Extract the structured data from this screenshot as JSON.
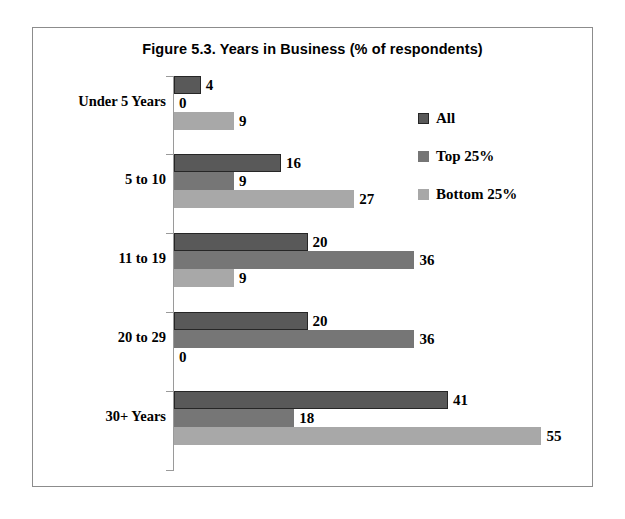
{
  "chart_data": {
    "type": "bar",
    "orientation": "horizontal",
    "title": "Figure 5.3. Years in Business (% of respondents)",
    "xlabel": "",
    "ylabel": "",
    "categories": [
      "Under 5 Years",
      "5 to 10",
      "11 to 19",
      "20 to 29",
      "30+ Years"
    ],
    "series": [
      {
        "name": "All",
        "color": "#595959",
        "values": [
          4,
          16,
          20,
          20,
          41
        ]
      },
      {
        "name": "Top 25%",
        "color": "#767676",
        "values": [
          0,
          9,
          36,
          36,
          18
        ]
      },
      {
        "name": "Bottom 25%",
        "color": "#a8a8a8",
        "values": [
          9,
          27,
          9,
          0,
          55
        ]
      }
    ],
    "xlim": [
      0,
      60
    ],
    "grid": false,
    "legend_position": "right-top",
    "data_labels": true,
    "axis_line_color": "#9a9a9a",
    "frame_color": "#8c8c8c"
  },
  "legend": {
    "items": [
      {
        "label": "All",
        "swatch": "series-all"
      },
      {
        "label": "Top 25%",
        "swatch": "series-top"
      },
      {
        "label": "Bottom 25%",
        "swatch": "series-bottom"
      }
    ]
  }
}
